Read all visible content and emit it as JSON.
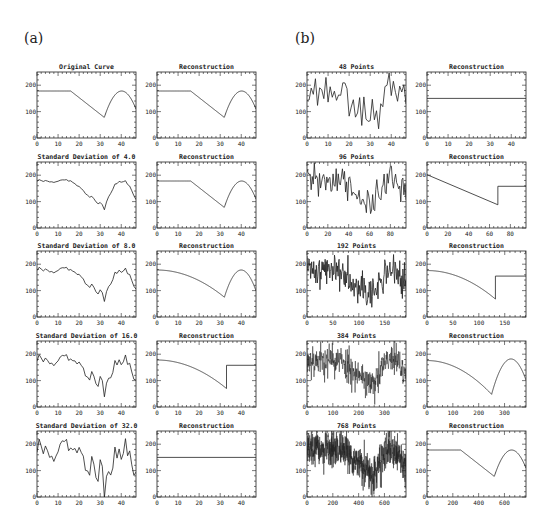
{
  "figure": {
    "panel_a_label": "(a)",
    "panel_b_label": "(b)"
  },
  "chart_data": [
    {
      "panel": "a",
      "row": 0,
      "col": 0,
      "type": "line",
      "title": "Original Curve",
      "kind": "piecewise",
      "n": 48,
      "xlim": [
        0,
        47
      ],
      "xticks": [
        0,
        10,
        20,
        30,
        40
      ],
      "ylim": [
        0,
        250
      ],
      "yticks": [
        0,
        100,
        200
      ],
      "noise_sd": 0,
      "shape": "true"
    },
    {
      "panel": "a",
      "row": 0,
      "col": 1,
      "type": "line",
      "title": "Reconstruction",
      "kind": "true",
      "xlim": [
        0,
        47
      ],
      "xticks": [
        0,
        10,
        20,
        30,
        40
      ],
      "ylim": [
        0,
        250
      ],
      "yticks": [
        0,
        100,
        200
      ]
    },
    {
      "panel": "a",
      "row": 1,
      "col": 0,
      "type": "line",
      "title": "Standard Deviation of 4.0",
      "kind": "noisy",
      "n": 48,
      "noise_sd": 4.0,
      "seed": 11,
      "xlim": [
        0,
        47
      ],
      "xticks": [
        0,
        10,
        20,
        30,
        40
      ],
      "ylim": [
        0,
        250
      ],
      "yticks": [
        0,
        100,
        200
      ]
    },
    {
      "panel": "a",
      "row": 1,
      "col": 1,
      "type": "line",
      "title": "Reconstruction",
      "kind": "true",
      "xlim": [
        0,
        47
      ],
      "xticks": [
        0,
        10,
        20,
        30,
        40
      ],
      "ylim": [
        0,
        250
      ],
      "yticks": [
        0,
        100,
        200
      ]
    },
    {
      "panel": "a",
      "row": 2,
      "col": 0,
      "type": "line",
      "title": "Standard Deviation of 8.0",
      "kind": "noisy",
      "n": 48,
      "noise_sd": 8.0,
      "seed": 11,
      "xlim": [
        0,
        47
      ],
      "xticks": [
        0,
        10,
        20,
        30,
        40
      ],
      "ylim": [
        0,
        250
      ],
      "yticks": [
        0,
        100,
        200
      ]
    },
    {
      "panel": "a",
      "row": 2,
      "col": 1,
      "type": "line",
      "title": "Reconstruction",
      "kind": "smooth_drop",
      "break_x": 32,
      "left_start": 178,
      "left_min": 75,
      "right_peak": 178,
      "right_peak_x": 40,
      "right_end": 118,
      "xlim": [
        0,
        47
      ],
      "xticks": [
        0,
        10,
        20,
        30,
        40
      ],
      "ylim": [
        0,
        250
      ],
      "yticks": [
        0,
        100,
        200
      ]
    },
    {
      "panel": "a",
      "row": 3,
      "col": 0,
      "type": "line",
      "title": "Standard Deviation of 16.0",
      "kind": "noisy",
      "n": 48,
      "noise_sd": 16.0,
      "seed": 11,
      "xlim": [
        0,
        47
      ],
      "xticks": [
        0,
        10,
        20,
        30,
        40
      ],
      "ylim": [
        0,
        250
      ],
      "yticks": [
        0,
        100,
        200
      ]
    },
    {
      "panel": "a",
      "row": 3,
      "col": 1,
      "type": "line",
      "title": "Reconstruction",
      "kind": "curve_step",
      "break_x": 33,
      "left_start": 178,
      "left_min": 70,
      "step_level": 158,
      "xlim": [
        0,
        47
      ],
      "xticks": [
        0,
        10,
        20,
        30,
        40
      ],
      "ylim": [
        0,
        250
      ],
      "yticks": [
        0,
        100,
        200
      ]
    },
    {
      "panel": "a",
      "row": 4,
      "col": 0,
      "type": "line",
      "title": "Standard Deviation of 32.0",
      "kind": "noisy",
      "n": 48,
      "noise_sd": 32.0,
      "seed": 11,
      "xlim": [
        0,
        47
      ],
      "xticks": [
        0,
        10,
        20,
        30,
        40
      ],
      "ylim": [
        0,
        250
      ],
      "yticks": [
        0,
        100,
        200
      ]
    },
    {
      "panel": "a",
      "row": 4,
      "col": 1,
      "type": "line",
      "title": "Reconstruction",
      "kind": "flat",
      "level": 150,
      "xlim": [
        0,
        47
      ],
      "xticks": [
        0,
        10,
        20,
        30,
        40
      ],
      "ylim": [
        0,
        250
      ],
      "yticks": [
        0,
        100,
        200
      ]
    },
    {
      "panel": "b",
      "row": 0,
      "col": 0,
      "type": "line",
      "title": "48 Points",
      "kind": "noisy",
      "n": 48,
      "noise_sd": 32.0,
      "seed": 23,
      "xlim": [
        0,
        47
      ],
      "xticks": [
        0,
        10,
        20,
        30,
        40
      ],
      "ylim": [
        0,
        250
      ],
      "yticks": [
        0,
        100,
        200
      ]
    },
    {
      "panel": "b",
      "row": 0,
      "col": 1,
      "type": "line",
      "title": "Reconstruction",
      "kind": "flat",
      "level": 150,
      "xlim": [
        0,
        47
      ],
      "xticks": [
        0,
        10,
        20,
        30,
        40
      ],
      "ylim": [
        0,
        250
      ],
      "yticks": [
        0,
        100,
        200
      ]
    },
    {
      "panel": "b",
      "row": 1,
      "col": 0,
      "type": "line",
      "title": "96 Points",
      "kind": "noisy",
      "n": 96,
      "noise_sd": 32.0,
      "seed": 31,
      "xlim": [
        0,
        95
      ],
      "xticks": [
        0,
        20,
        40,
        60,
        80
      ],
      "ylim": [
        0,
        250
      ],
      "yticks": [
        0,
        100,
        200
      ]
    },
    {
      "panel": "b",
      "row": 1,
      "col": 1,
      "type": "line",
      "title": "Reconstruction",
      "kind": "line_step",
      "start": 202,
      "break_x": 68,
      "break_y": 88,
      "step_level": 158,
      "xlim": [
        0,
        95
      ],
      "xticks": [
        0,
        20,
        40,
        60,
        80
      ],
      "ylim": [
        0,
        250
      ],
      "yticks": [
        0,
        100,
        200
      ]
    },
    {
      "panel": "b",
      "row": 2,
      "col": 0,
      "type": "line",
      "title": "192 Points",
      "kind": "noisy",
      "n": 192,
      "noise_sd": 32.0,
      "seed": 41,
      "xlim": [
        0,
        191
      ],
      "xticks": [
        0,
        50,
        100,
        150
      ],
      "ylim": [
        0,
        250
      ],
      "yticks": [
        0,
        100,
        200
      ]
    },
    {
      "panel": "b",
      "row": 2,
      "col": 1,
      "type": "line",
      "title": "Reconstruction",
      "kind": "curve_step",
      "break_x": 132,
      "left_start": 176,
      "left_min": 68,
      "step_level": 155,
      "xlim": [
        0,
        191
      ],
      "xticks": [
        0,
        50,
        100,
        150
      ],
      "ylim": [
        0,
        250
      ],
      "yticks": [
        0,
        100,
        200
      ]
    },
    {
      "panel": "b",
      "row": 3,
      "col": 0,
      "type": "line",
      "title": "384 Points",
      "kind": "noisy",
      "n": 384,
      "noise_sd": 32.0,
      "seed": 53,
      "xlim": [
        0,
        383
      ],
      "xticks": [
        0,
        100,
        200,
        300
      ],
      "ylim": [
        0,
        250
      ],
      "yticks": [
        0,
        100,
        200
      ]
    },
    {
      "panel": "b",
      "row": 3,
      "col": 1,
      "type": "line",
      "title": "Reconstruction",
      "kind": "smooth_drop",
      "break_x": 250,
      "left_start": 176,
      "left_min": 48,
      "right_peak": 182,
      "right_peak_x": 325,
      "right_end": 98,
      "xlim": [
        0,
        383
      ],
      "xticks": [
        0,
        100,
        200,
        300
      ],
      "ylim": [
        0,
        250
      ],
      "yticks": [
        0,
        100,
        200
      ]
    },
    {
      "panel": "b",
      "row": 4,
      "col": 0,
      "type": "line",
      "title": "768 Points",
      "kind": "noisy",
      "n": 768,
      "noise_sd": 32.0,
      "seed": 67,
      "xlim": [
        0,
        767
      ],
      "xticks": [
        0,
        200,
        400,
        600
      ],
      "ylim": [
        0,
        250
      ],
      "yticks": [
        0,
        100,
        200
      ]
    },
    {
      "panel": "b",
      "row": 4,
      "col": 1,
      "type": "line",
      "title": "Reconstruction",
      "kind": "true",
      "xlim": [
        0,
        767
      ],
      "xticks": [
        0,
        200,
        400,
        600
      ],
      "ylim": [
        0,
        250
      ],
      "yticks": [
        0,
        100,
        200
      ]
    }
  ],
  "true_curve": {
    "description": "Piecewise: flat 178 until x=16/48 of range, linear drop to 78 at x=32/48, then parabolic arc peaking 178 at x=40/48, ending ~105 at right edge",
    "flat_level": 178,
    "flat_end_frac": 0.34,
    "min_frac": 0.68,
    "min_level": 78,
    "peak_frac": 0.855,
    "peak_level": 178,
    "end_level": 105
  },
  "layout": {
    "col_x": {
      "a0": 37,
      "a1": 157,
      "b0": 307,
      "b1": 427
    },
    "plot_w": 99,
    "plot_h": 66,
    "row_y": [
      72,
      162,
      251,
      341,
      431
    ]
  }
}
